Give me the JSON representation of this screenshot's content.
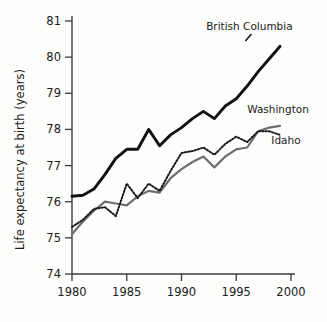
{
  "chart_data": {
    "type": "line",
    "title": "",
    "xlabel": "",
    "ylabel": "Life expectancy at birth (years)",
    "xlim": [
      1980,
      2000
    ],
    "ylim": [
      74,
      81
    ],
    "xticks": [
      1980,
      1985,
      1990,
      1995,
      2000
    ],
    "yticks": [
      74,
      75,
      76,
      77,
      78,
      79,
      80,
      81
    ],
    "grid": false,
    "legend_position": "inline-right",
    "x": [
      1980,
      1981,
      1982,
      1983,
      1984,
      1985,
      1986,
      1987,
      1988,
      1989,
      1990,
      1991,
      1992,
      1993,
      1994,
      1995,
      1996,
      1997,
      1998,
      1999
    ],
    "series": [
      {
        "name": "British Columbia",
        "style": "solid-thick-black",
        "color": "#111111",
        "values": [
          76.15,
          76.18,
          76.35,
          76.75,
          77.2,
          77.45,
          77.45,
          78.0,
          77.55,
          77.85,
          78.05,
          78.3,
          78.5,
          78.3,
          78.65,
          78.85,
          79.2,
          79.6,
          79.95,
          80.3
        ],
        "label_x": 1996.2,
        "label_y": 80.75
      },
      {
        "name": "Washington",
        "style": "solid-gray",
        "color": "#6e6e6e",
        "values": [
          75.1,
          75.45,
          75.75,
          76.0,
          75.95,
          75.9,
          76.15,
          76.3,
          76.25,
          76.65,
          76.9,
          77.1,
          77.25,
          76.95,
          77.25,
          77.45,
          77.5,
          77.95,
          78.05,
          78.1
        ],
        "label_x": 1996.0,
        "label_y": 78.45
      },
      {
        "name": "Idaho",
        "style": "dotted-black",
        "color": "#1a1a1a",
        "values": [
          75.3,
          75.5,
          75.8,
          75.85,
          75.6,
          76.5,
          76.1,
          76.5,
          76.3,
          76.85,
          77.35,
          77.4,
          77.5,
          77.3,
          77.6,
          77.8,
          77.65,
          77.95,
          77.95,
          77.85
        ],
        "label_x": 1998.2,
        "label_y": 77.6
      }
    ]
  }
}
